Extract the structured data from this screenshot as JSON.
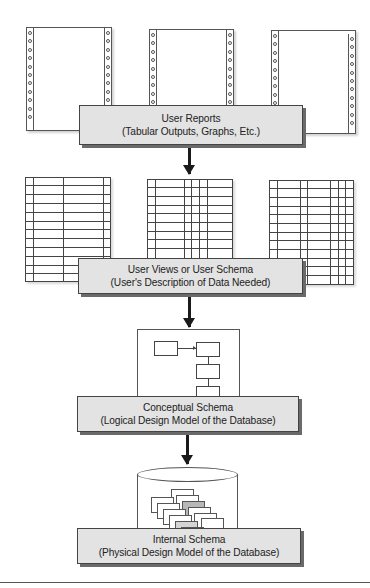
{
  "diagram": {
    "levels": [
      {
        "id": "user-reports",
        "title": "User Reports",
        "subtitle": "(Tabular Outputs, Graphs, Etc.)",
        "illustration": "continuous-form-printer-pages",
        "count": 3
      },
      {
        "id": "user-views",
        "title": "User Views or User Schema",
        "subtitle": "(User's Description of Data Needed)",
        "illustration": "table-grids",
        "count": 3
      },
      {
        "id": "conceptual-schema",
        "title": "Conceptual Schema",
        "subtitle": "(Logical Design Model of the Database)",
        "illustration": "entity-relationship-boxes"
      },
      {
        "id": "internal-schema",
        "title": "Internal Schema",
        "subtitle": "(Physical Design Model of the Database)",
        "illustration": "database-cylinder-with-records"
      }
    ],
    "arrows": [
      {
        "from": "user-reports",
        "to": "user-views",
        "direction": "down"
      },
      {
        "from": "user-views",
        "to": "conceptual-schema",
        "direction": "down"
      },
      {
        "from": "conceptual-schema",
        "to": "internal-schema",
        "direction": "down"
      }
    ],
    "colors": {
      "label_box_fill": "#e3e3e3",
      "label_box_shadow": "#6a6a6a",
      "arrow": "#1a1a1a",
      "line": "#444444",
      "record_highlight": "#b8b8b8"
    }
  }
}
